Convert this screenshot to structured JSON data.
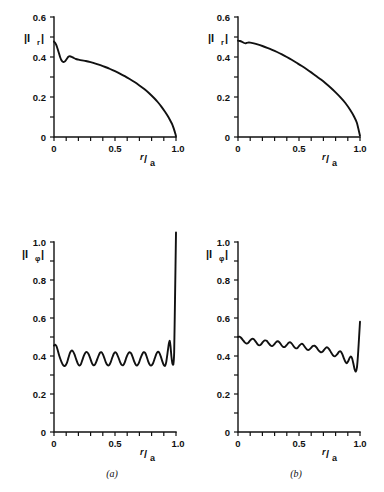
{
  "figure": {
    "caption_a": "(a)",
    "caption_b": "(b)",
    "xlabel_numerator": "r",
    "xlabel_slash": "/",
    "xlabel_denominator": "a"
  },
  "chart_data": [
    {
      "id": "top-left",
      "panel": "(a)",
      "type": "line",
      "title": "",
      "xlabel": "r/a",
      "ylabel": "|I_r|",
      "ylabel_main": "|I",
      "ylabel_sub": "r",
      "ylabel_close": "|",
      "xlim": [
        0,
        1.0
      ],
      "ylim": [
        0,
        0.6
      ],
      "xticks": [
        0,
        0.5,
        1.0
      ],
      "xtick_labels": [
        "0",
        "0.5",
        "1.0"
      ],
      "xminor_step": 0.1,
      "yticks": [
        0,
        0.2,
        0.4,
        0.6
      ],
      "ytick_labels": [
        "0",
        "0.2",
        "0.4",
        "0.6"
      ],
      "yminor_step": 0.1,
      "grid": false,
      "legend": "none",
      "x": [
        0.0,
        0.01,
        0.02,
        0.03,
        0.04,
        0.05,
        0.06,
        0.07,
        0.08,
        0.09,
        0.1,
        0.11,
        0.12,
        0.13,
        0.145,
        0.16,
        0.18,
        0.2,
        0.23,
        0.26,
        0.3,
        0.34,
        0.38,
        0.42,
        0.46,
        0.5,
        0.54,
        0.58,
        0.62,
        0.66,
        0.7,
        0.74,
        0.78,
        0.82,
        0.85,
        0.88,
        0.91,
        0.935,
        0.955,
        0.97,
        0.982,
        0.99,
        0.995,
        1.0
      ],
      "y": [
        0.477,
        0.47,
        0.458,
        0.44,
        0.42,
        0.4,
        0.385,
        0.377,
        0.375,
        0.378,
        0.386,
        0.395,
        0.402,
        0.404,
        0.401,
        0.396,
        0.39,
        0.387,
        0.383,
        0.38,
        0.374,
        0.367,
        0.359,
        0.35,
        0.34,
        0.329,
        0.317,
        0.304,
        0.29,
        0.275,
        0.258,
        0.24,
        0.219,
        0.195,
        0.175,
        0.152,
        0.126,
        0.102,
        0.08,
        0.062,
        0.042,
        0.026,
        0.016,
        0.004
      ]
    },
    {
      "id": "top-right",
      "panel": "(b)",
      "type": "line",
      "title": "",
      "xlabel": "r/a",
      "ylabel": "|I_r|",
      "ylabel_main": "|I",
      "ylabel_sub": "r",
      "ylabel_close": "|",
      "xlim": [
        0,
        1.0
      ],
      "ylim": [
        0,
        0.6
      ],
      "xticks": [
        0,
        0.5,
        1.0
      ],
      "xtick_labels": [
        "0",
        "0.5",
        "1.0"
      ],
      "xminor_step": 0.1,
      "yticks": [
        0,
        0.2,
        0.4,
        0.6
      ],
      "ytick_labels": [
        "0",
        "0.2",
        "0.4",
        "0.6"
      ],
      "yminor_step": 0.1,
      "grid": false,
      "legend": "none",
      "x": [
        0.0,
        0.015,
        0.03,
        0.045,
        0.06,
        0.08,
        0.1,
        0.13,
        0.16,
        0.2,
        0.24,
        0.28,
        0.32,
        0.36,
        0.4,
        0.44,
        0.48,
        0.52,
        0.56,
        0.6,
        0.64,
        0.68,
        0.72,
        0.76,
        0.8,
        0.84,
        0.88,
        0.92,
        0.95,
        0.975,
        1.0
      ],
      "y": [
        0.482,
        0.48,
        0.477,
        0.472,
        0.468,
        0.472,
        0.472,
        0.468,
        0.463,
        0.455,
        0.446,
        0.436,
        0.425,
        0.413,
        0.4,
        0.386,
        0.371,
        0.356,
        0.34,
        0.323,
        0.305,
        0.287,
        0.267,
        0.246,
        0.223,
        0.198,
        0.17,
        0.135,
        0.104,
        0.07,
        0.006
      ]
    },
    {
      "id": "bottom-left",
      "panel": "(a)",
      "type": "line",
      "title": "",
      "xlabel": "r/a",
      "ylabel": "|I_phi|",
      "ylabel_main": "|I",
      "ylabel_sub": "φ",
      "ylabel_close": "|",
      "xlim": [
        0,
        1.0
      ],
      "ylim": [
        0,
        1.05
      ],
      "xticks": [
        0,
        0.5,
        1.0
      ],
      "xtick_labels": [
        "0",
        "0.5",
        "1.0"
      ],
      "xminor_step": 0.1,
      "yticks": [
        0,
        0.2,
        0.4,
        0.6,
        0.8,
        1.0
      ],
      "ytick_labels": [
        "0",
        "0.2",
        "0.4",
        "0.6",
        "0.8",
        "1.0"
      ],
      "yminor_step": 0.1,
      "grid": false,
      "legend": "none",
      "oscillation_cycles": 12,
      "baseline": 0.39,
      "amplitude": 0.035,
      "spike_x": 0.955,
      "spike_peak": 1.05,
      "x": [
        0.0,
        0.01,
        0.02,
        0.03,
        0.04,
        0.05,
        0.062,
        0.075,
        0.09,
        0.105,
        0.118,
        0.13,
        0.142,
        0.155,
        0.168,
        0.182,
        0.195,
        0.208,
        0.22,
        0.232,
        0.245,
        0.258,
        0.272,
        0.285,
        0.298,
        0.31,
        0.322,
        0.335,
        0.348,
        0.362,
        0.375,
        0.388,
        0.4,
        0.412,
        0.425,
        0.438,
        0.452,
        0.465,
        0.478,
        0.49,
        0.502,
        0.515,
        0.528,
        0.542,
        0.555,
        0.568,
        0.58,
        0.592,
        0.605,
        0.618,
        0.632,
        0.645,
        0.658,
        0.67,
        0.682,
        0.695,
        0.708,
        0.722,
        0.735,
        0.748,
        0.76,
        0.772,
        0.785,
        0.798,
        0.812,
        0.825,
        0.838,
        0.85,
        0.862,
        0.875,
        0.888,
        0.9,
        0.91,
        0.92,
        0.93,
        0.94,
        0.948,
        0.955,
        0.962,
        0.97,
        0.978,
        0.985,
        0.992,
        1.0
      ],
      "y": [
        0.455,
        0.46,
        0.452,
        0.432,
        0.408,
        0.388,
        0.368,
        0.352,
        0.348,
        0.362,
        0.39,
        0.415,
        0.428,
        0.425,
        0.408,
        0.382,
        0.36,
        0.35,
        0.356,
        0.378,
        0.402,
        0.418,
        0.42,
        0.408,
        0.386,
        0.364,
        0.352,
        0.354,
        0.372,
        0.396,
        0.415,
        0.42,
        0.41,
        0.39,
        0.366,
        0.352,
        0.352,
        0.368,
        0.392,
        0.412,
        0.42,
        0.412,
        0.392,
        0.368,
        0.353,
        0.352,
        0.366,
        0.39,
        0.41,
        0.42,
        0.414,
        0.394,
        0.37,
        0.354,
        0.35,
        0.362,
        0.386,
        0.408,
        0.42,
        0.415,
        0.396,
        0.372,
        0.354,
        0.35,
        0.362,
        0.386,
        0.41,
        0.422,
        0.418,
        0.398,
        0.372,
        0.352,
        0.348,
        0.368,
        0.412,
        0.46,
        0.48,
        0.452,
        0.4,
        0.362,
        0.355,
        0.42,
        0.7,
        1.05
      ]
    },
    {
      "id": "bottom-right",
      "panel": "(b)",
      "type": "line",
      "title": "",
      "xlabel": "r/a",
      "ylabel": "|I_phi|",
      "ylabel_main": "|I",
      "ylabel_sub": "φ",
      "ylabel_close": "|",
      "xlim": [
        0,
        1.0
      ],
      "ylim": [
        0,
        1.0
      ],
      "xticks": [
        0,
        0.5,
        1.0
      ],
      "xtick_labels": [
        "0",
        "0.5",
        "1.0"
      ],
      "xminor_step": 0.1,
      "yticks": [
        0,
        0.2,
        0.4,
        0.6,
        0.8,
        1.0
      ],
      "ytick_labels": [
        "0",
        "0.2",
        "0.4",
        "0.6",
        "0.8",
        "1.0"
      ],
      "yminor_step": 0.1,
      "grid": false,
      "legend": "none",
      "oscillation_cycles": 11,
      "baseline_start": 0.49,
      "baseline_end": 0.375,
      "amplitude": 0.022,
      "end_rise": 0.58,
      "x": [
        0.0,
        0.012,
        0.025,
        0.04,
        0.055,
        0.07,
        0.085,
        0.1,
        0.115,
        0.13,
        0.145,
        0.16,
        0.175,
        0.19,
        0.205,
        0.22,
        0.235,
        0.25,
        0.265,
        0.28,
        0.295,
        0.31,
        0.325,
        0.34,
        0.355,
        0.37,
        0.385,
        0.4,
        0.415,
        0.43,
        0.445,
        0.46,
        0.475,
        0.49,
        0.505,
        0.52,
        0.535,
        0.55,
        0.565,
        0.58,
        0.595,
        0.612,
        0.628,
        0.645,
        0.662,
        0.678,
        0.695,
        0.712,
        0.728,
        0.745,
        0.762,
        0.778,
        0.795,
        0.812,
        0.828,
        0.842,
        0.855,
        0.868,
        0.88,
        0.892,
        0.903,
        0.915,
        0.925,
        0.935,
        0.945,
        0.955,
        0.965,
        0.975,
        0.985,
        1.0
      ],
      "y": [
        0.5,
        0.502,
        0.496,
        0.484,
        0.472,
        0.466,
        0.47,
        0.482,
        0.49,
        0.488,
        0.476,
        0.462,
        0.456,
        0.462,
        0.474,
        0.482,
        0.48,
        0.468,
        0.456,
        0.452,
        0.46,
        0.472,
        0.478,
        0.472,
        0.458,
        0.448,
        0.448,
        0.458,
        0.47,
        0.472,
        0.462,
        0.448,
        0.44,
        0.444,
        0.456,
        0.464,
        0.46,
        0.446,
        0.434,
        0.432,
        0.44,
        0.452,
        0.454,
        0.444,
        0.428,
        0.42,
        0.424,
        0.438,
        0.446,
        0.438,
        0.42,
        0.404,
        0.398,
        0.408,
        0.422,
        0.424,
        0.41,
        0.388,
        0.37,
        0.362,
        0.372,
        0.39,
        0.398,
        0.388,
        0.362,
        0.332,
        0.318,
        0.34,
        0.42,
        0.58
      ]
    }
  ]
}
